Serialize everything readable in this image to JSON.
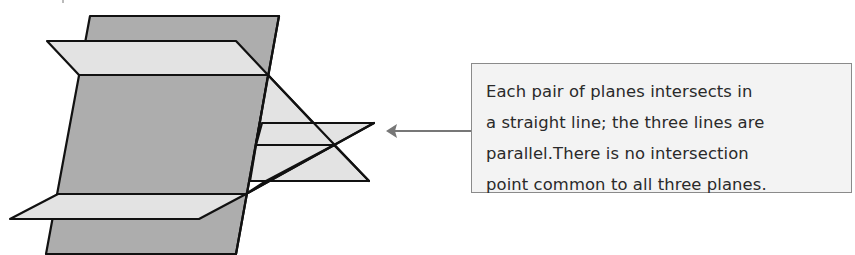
{
  "diagram": {
    "colors": {
      "back_plane": "#adadad",
      "horizontal_planes": "#e3e3e3",
      "outline": "#111111",
      "arrow": "#777777",
      "callout_background": "#f3f3f3",
      "callout_border": "#8a8a8a"
    },
    "planes": [
      {
        "name": "vertical-plane",
        "shade": "dark"
      },
      {
        "name": "upper-horizontal-plane",
        "shade": "light"
      },
      {
        "name": "lower-horizontal-plane",
        "shade": "light"
      },
      {
        "name": "slanted-plane",
        "shade": "light"
      }
    ],
    "callout": {
      "lines": [
        "Each pair of planes intersects in",
        "a straight line; the three lines are",
        "parallel.There is no intersection",
        "point common to all three planes."
      ]
    }
  }
}
